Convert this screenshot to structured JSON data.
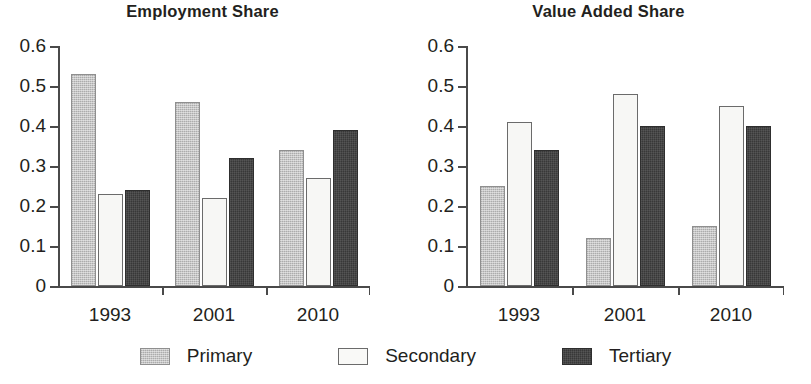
{
  "figure": {
    "background": "#ffffff",
    "ink_color": "#231f20"
  },
  "legend": {
    "position": "bottom-center",
    "entries": [
      {
        "label": "Primary",
        "key": "primary",
        "color": "#b9b9b9",
        "style": "light-gray-dithered"
      },
      {
        "label": "Secondary",
        "key": "secondary",
        "color": "#f7f7f5",
        "style": "white-outlined"
      },
      {
        "label": "Tertiary",
        "key": "tertiary",
        "color": "#3e3e3e",
        "style": "dark-charcoal"
      }
    ]
  },
  "chart_data": [
    {
      "type": "bar",
      "title": "Employment Share",
      "xlabel": "",
      "ylabel": "",
      "categories": [
        "1993",
        "2001",
        "2010"
      ],
      "ylim": [
        0,
        0.6
      ],
      "yticks": [
        "0",
        "0.1",
        "0.2",
        "0.3",
        "0.4",
        "0.5",
        "0.6"
      ],
      "ytick_values": [
        0,
        0.1,
        0.2,
        0.3,
        0.4,
        0.5,
        0.6
      ],
      "grid": false,
      "series": [
        {
          "name": "Primary",
          "values": [
            0.53,
            0.46,
            0.34
          ]
        },
        {
          "name": "Secondary",
          "values": [
            0.23,
            0.22,
            0.27
          ]
        },
        {
          "name": "Tertiary",
          "values": [
            0.24,
            0.32,
            0.39
          ]
        }
      ]
    },
    {
      "type": "bar",
      "title": "Value Added Share",
      "xlabel": "",
      "ylabel": "",
      "categories": [
        "1993",
        "2001",
        "2010"
      ],
      "ylim": [
        0,
        0.6
      ],
      "yticks": [
        "0",
        "0.1",
        "0.2",
        "0.3",
        "0.4",
        "0.5",
        "0.6"
      ],
      "ytick_values": [
        0,
        0.1,
        0.2,
        0.3,
        0.4,
        0.5,
        0.6
      ],
      "grid": false,
      "series": [
        {
          "name": "Primary",
          "values": [
            0.25,
            0.12,
            0.15
          ]
        },
        {
          "name": "Secondary",
          "values": [
            0.41,
            0.48,
            0.45
          ]
        },
        {
          "name": "Tertiary",
          "values": [
            0.34,
            0.4,
            0.4
          ]
        }
      ]
    }
  ]
}
